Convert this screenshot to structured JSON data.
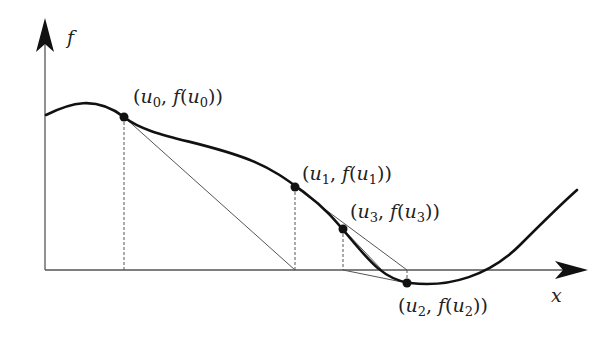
{
  "figure": {
    "axes": {
      "y_label": "f",
      "x_label": "x"
    },
    "points": [
      {
        "id": "u0",
        "label_var": "u",
        "label_sub": "0",
        "text": "(u0, f(u0))",
        "x": 124,
        "y": 117
      },
      {
        "id": "u1",
        "label_var": "u",
        "label_sub": "1",
        "text": "(u1, f(u1))",
        "x": 295,
        "y": 187
      },
      {
        "id": "u3",
        "label_var": "u",
        "label_sub": "3",
        "text": "(u3, f(u3))",
        "x": 343,
        "y": 229
      },
      {
        "id": "u2",
        "label_var": "u",
        "label_sub": "2",
        "text": "(u2, f(u2))",
        "x": 407,
        "y": 283
      }
    ],
    "colors": {
      "curve": "#111111",
      "axis": "#555555",
      "secant": "#555555",
      "point": "#111111"
    }
  }
}
